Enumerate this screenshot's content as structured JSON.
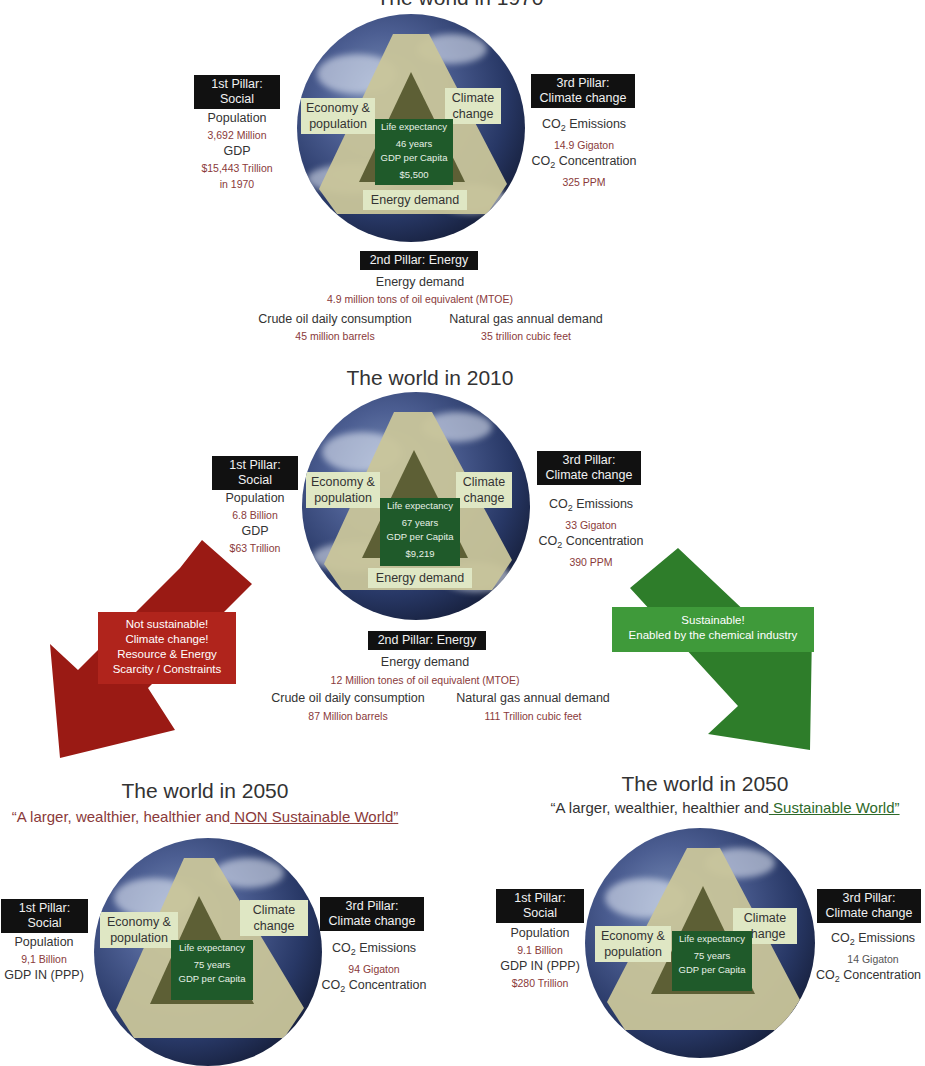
{
  "panels": {
    "w1970": {
      "title": "The world in 1970",
      "pillar1": {
        "heading_line1": "1st Pillar:",
        "heading_line2": "Social",
        "population_label": "Population",
        "population_value": "3,692 Million",
        "gdp_label": "GDP",
        "gdp_value": "$15,443 Trillion",
        "gdp_note": "in 1970"
      },
      "pillar3": {
        "heading_line1": "3rd Pillar:",
        "heading_line2": "Climate change",
        "emissions_label_pre": "CO",
        "emissions_label_sub": "2",
        "emissions_label_post": " Emissions",
        "emissions_value": "14.9 Gigaton",
        "conc_label_pre": "CO",
        "conc_label_sub": "2",
        "conc_label_post": " Concentration",
        "conc_value": "325 PPM"
      },
      "globe": {
        "economy_tag_l1": "Economy &",
        "economy_tag_l2": "population",
        "climate_tag_l1": "Climate",
        "climate_tag_l2": "change",
        "energy_tag": "Energy demand",
        "life_label": "Life expectancy",
        "life_value": "46 years",
        "gdp_capita_label": "GDP per Capita",
        "gdp_capita_value": "$5,500"
      },
      "pillar2": {
        "heading": "2nd Pillar: Energy",
        "energy_label": "Energy demand",
        "energy_value": "4.9 million tons of oil equivalent (MTOE)",
        "oil_label": "Crude oil daily consumption",
        "oil_value": "45 million barrels",
        "gas_label": "Natural gas annual demand",
        "gas_value": "35 trillion cubic feet"
      }
    },
    "w2010": {
      "title": "The world in 2010",
      "pillar1": {
        "heading_line1": "1st Pillar:",
        "heading_line2": "Social",
        "population_label": "Population",
        "population_value": "6.8 Billion",
        "gdp_label": "GDP",
        "gdp_value": "$63 Trillion"
      },
      "pillar3": {
        "heading_line1": "3rd Pillar:",
        "heading_line2": "Climate change",
        "emissions_label_pre": "CO",
        "emissions_label_sub": "2",
        "emissions_label_post": " Emissions",
        "emissions_value": "33 Gigaton",
        "conc_label_pre": "CO",
        "conc_label_sub": "2",
        "conc_label_post": " Concentration",
        "conc_value": "390 PPM"
      },
      "globe": {
        "economy_tag_l1": "Economy &",
        "economy_tag_l2": "population",
        "climate_tag_l1": "Climate",
        "climate_tag_l2": "change",
        "energy_tag": "Energy demand",
        "life_label": "Life expectancy",
        "life_value": "67 years",
        "gdp_capita_label": "GDP per Capita",
        "gdp_capita_value": "$9,219"
      },
      "pillar2": {
        "heading": "2nd Pillar: Energy",
        "energy_label": "Energy demand",
        "energy_value": "12 Million tones of oil equivalent (MTOE)",
        "oil_label": "Crude oil daily consumption",
        "oil_value": "87 Million barrels",
        "gas_label": "Natural gas annual demand",
        "gas_value": "111 Trillion cubic feet"
      }
    },
    "w2050_non": {
      "title": "The world in 2050",
      "subtitle_pre": "“A larger, wealthier, healthier and",
      "subtitle_u": " NON Sustainable World”",
      "pillar1": {
        "heading_line1": "1st Pillar:",
        "heading_line2": "Social",
        "population_label": "Population",
        "population_value": "9,1 Billion",
        "gdp_label": "GDP IN (PPP)"
      },
      "pillar3": {
        "heading_line1": "3rd Pillar:",
        "heading_line2": "Climate change",
        "emissions_label_pre": "CO",
        "emissions_label_sub": "2",
        "emissions_label_post": " Emissions",
        "emissions_value": "94 Gigaton",
        "conc_label_pre": "CO",
        "conc_label_sub": "2",
        "conc_label_post": " Concentration"
      },
      "globe": {
        "economy_tag_l1": "Economy &",
        "economy_tag_l2": "population",
        "climate_tag_l1": "Climate",
        "climate_tag_l2": "change",
        "life_label": "Life expectancy",
        "life_value": "75 years",
        "gdp_capita_label": "GDP per Capita"
      }
    },
    "w2050_sus": {
      "title": "The world in 2050",
      "subtitle_pre": "“A larger, wealthier, healthier and",
      "subtitle_u": " Sustainable World”",
      "pillar1": {
        "heading_line1": "1st Pillar:",
        "heading_line2": "Social",
        "population_label": "Population",
        "population_value": "9.1 Billion",
        "gdp_label": "GDP IN (PPP)",
        "gdp_value_partial": "$280 Trillion"
      },
      "pillar3": {
        "heading_line1": "3rd Pillar:",
        "heading_line2": "Climate change",
        "emissions_label_pre": "CO",
        "emissions_label_sub": "2",
        "emissions_label_post": " Emissions",
        "emissions_value": "14 Gigaton",
        "conc_label_pre": "CO",
        "conc_label_sub": "2",
        "conc_label_post": " Concentration"
      },
      "globe": {
        "economy_tag_l1": "Economy &",
        "economy_tag_l2": "population",
        "climate_tag_l1": "Climate",
        "climate_tag_l2": "change",
        "life_label": "Life expectancy",
        "life_value": "75 years",
        "gdp_capita_label": "GDP per Capita"
      }
    }
  },
  "arrows": {
    "red": {
      "line1": "Not sustainable!",
      "line2": "Climate change!",
      "line3": "Resource & Energy",
      "line4": "Scarcity / Constraints",
      "color": "#9a1a14",
      "box_color": "#b0241c"
    },
    "green": {
      "line1": "Sustainable!",
      "line2": "Enabled by the chemical industry",
      "color": "#2e7d2a",
      "box_color": "#3f9a3a"
    }
  },
  "colors": {
    "value_text": "#8a3a3a",
    "pillar_bg": "#111111",
    "tag_bg": "#dfe7c4",
    "life_bg": "#1f5a2a",
    "triangle": "#c9c59a"
  }
}
